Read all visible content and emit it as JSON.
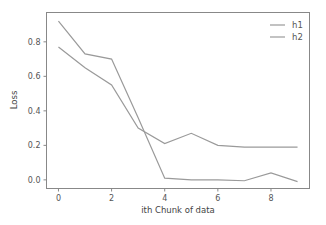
{
  "chart_data": {
    "type": "line",
    "title": "",
    "xlabel": "ith Chunk of data",
    "ylabel": "Loss",
    "x": [
      0,
      1,
      2,
      3,
      4,
      5,
      6,
      7,
      8,
      9
    ],
    "series": [
      {
        "name": "h1",
        "color": "#9a9a9a",
        "values": [
          0.92,
          0.73,
          0.7,
          0.36,
          0.01,
          0.0,
          0.0,
          -0.005,
          0.04,
          -0.01
        ]
      },
      {
        "name": "h2",
        "color": "#9a9a9a",
        "values": [
          0.77,
          0.65,
          0.55,
          0.3,
          0.21,
          0.27,
          0.2,
          0.19,
          0.19,
          0.19
        ]
      }
    ],
    "xticks": [
      "0",
      "2",
      "4",
      "6",
      "8"
    ],
    "xtick_values": [
      0,
      2,
      4,
      6,
      8
    ],
    "yticks": [
      "0.0",
      "0.2",
      "0.4",
      "0.6",
      "0.8"
    ],
    "ytick_values": [
      0.0,
      0.2,
      0.4,
      0.6,
      0.8
    ],
    "xlim": [
      -0.45,
      9.45
    ],
    "ylim": [
      -0.05,
      0.97
    ],
    "grid": false,
    "legend_position": "upper right"
  }
}
